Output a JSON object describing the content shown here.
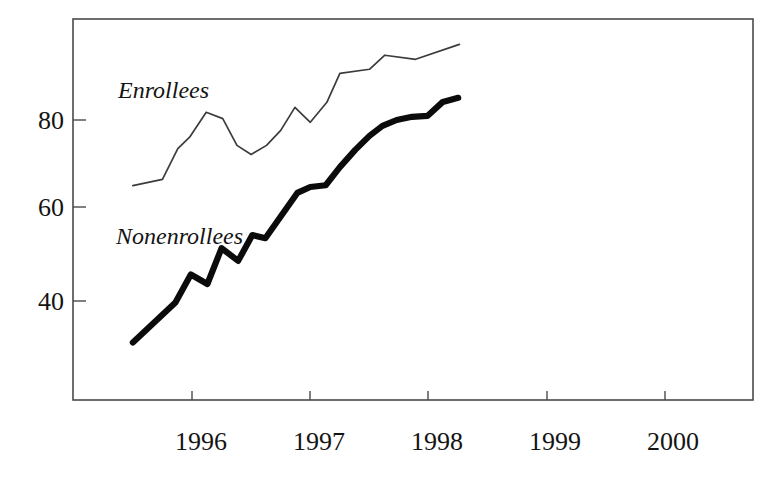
{
  "chart_data": {
    "type": "line",
    "title": "",
    "subtitle": "",
    "xlabel": "",
    "ylabel": "",
    "xlim": [
      1995.5,
      2000.92
    ],
    "ylim": [
      22.0,
      100.0
    ],
    "grid": false,
    "legend_position": "inline-annotation",
    "y_ticks": [
      40,
      60,
      80
    ],
    "y_tick_labels": [
      "40",
      "60",
      "80"
    ],
    "x_ticks": [
      1996,
      1997,
      1998,
      1999,
      2000
    ],
    "x_tick_labels": [
      "1996",
      "1997",
      "1998",
      "1999",
      "2000"
    ],
    "annotations": [
      {
        "text": "Enrollees",
        "x": 1995.92,
        "y": 88.5
      },
      {
        "text": "Nonenrollees",
        "x": 1995.9,
        "y": 57.0
      }
    ],
    "series": [
      {
        "name": "Enrollees",
        "style": "thin",
        "color": "#3c3c3c",
        "x": [
          1995.5,
          1995.75,
          1995.88,
          1995.98,
          1996.12,
          1996.26,
          1996.38,
          1996.5,
          1996.63,
          1996.75,
          1996.87,
          1997.0,
          1997.14,
          1997.25,
          1997.5,
          1997.63,
          1997.89,
          1998.26
        ],
        "values": [
          65.5,
          66.9,
          73.7,
          76.2,
          81.7,
          80.3,
          74.4,
          72.4,
          74.4,
          77.7,
          82.8,
          79.5,
          83.9,
          90.3,
          91.2,
          94.3,
          93.4,
          96.7
        ]
      },
      {
        "name": "Nonenrollees",
        "style": "thick",
        "color": "#0b0b0b",
        "x": [
          1995.5,
          1995.86,
          1995.99,
          1996.13,
          1996.25,
          1996.39,
          1996.51,
          1996.62,
          1996.89,
          1997.0,
          1997.13,
          1997.25,
          1997.38,
          1997.5,
          1997.61,
          1997.73,
          1997.86,
          1997.99,
          1998.12,
          1998.25
        ],
        "values": [
          30.9,
          39.7,
          45.9,
          43.8,
          51.7,
          48.9,
          54.6,
          53.9,
          63.9,
          65.2,
          65.6,
          69.6,
          73.4,
          76.5,
          78.7,
          80.0,
          80.7,
          80.9,
          84.0,
          84.9
        ]
      }
    ]
  },
  "plot_geometry": {
    "frame_left": 73,
    "frame_right": 753,
    "frame_top": 19,
    "frame_bottom": 400,
    "x_pixel_at_1996": 192,
    "x_pixels_per_year": 118.3,
    "y_pixel_at_80": 120,
    "y_pixels_per_unit": 4.53
  }
}
